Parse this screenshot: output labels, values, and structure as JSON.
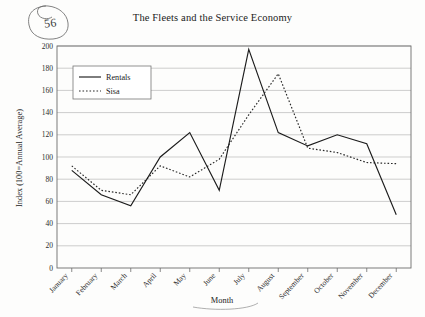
{
  "page": {
    "number": "56",
    "title": "The Fleets and the Service Economy"
  },
  "chart_data": {
    "type": "line",
    "title": "The Fleets and the Service Economy",
    "xlabel": "Month",
    "ylabel": "Index (100=Annual Average)",
    "categories": [
      "January",
      "February",
      "March",
      "April",
      "May",
      "June",
      "July",
      "August",
      "September",
      "October",
      "November",
      "December"
    ],
    "series": [
      {
        "name": "Rentals",
        "style": "solid",
        "values": [
          88,
          66,
          56,
          100,
          122,
          70,
          197,
          122,
          110,
          120,
          112,
          48
        ]
      },
      {
        "name": "Sisa",
        "style": "dotted",
        "values": [
          92,
          70,
          66,
          92,
          82,
          98,
          138,
          175,
          108,
          104,
          95,
          94
        ]
      }
    ],
    "ylim": [
      0,
      200
    ],
    "ytick_step": 20,
    "yticks": [
      "0",
      "20",
      "40",
      "60",
      "80",
      "100",
      "120",
      "140",
      "160",
      "180",
      "200"
    ],
    "grid": true,
    "legend_position": "top-left",
    "legend_entries": [
      "Rentals",
      "Sisa"
    ]
  },
  "axes": {
    "y_title": "Index (100=Annual Average)",
    "x_title": "Month"
  }
}
